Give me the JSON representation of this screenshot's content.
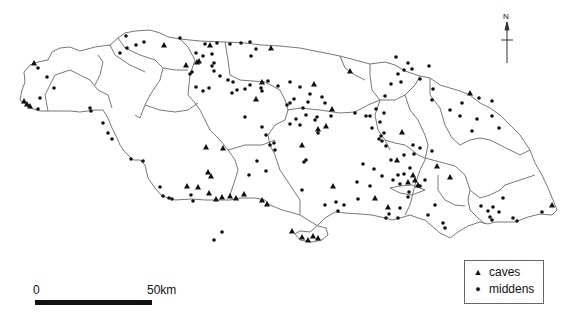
{
  "map": {
    "region": "Jamaica",
    "outline_color": "#777777",
    "symbol_color": "#111111"
  },
  "legend": {
    "items": [
      {
        "symbol": "triangle",
        "label": "caves"
      },
      {
        "symbol": "dot",
        "label": "middens"
      }
    ]
  },
  "scale_bar": {
    "start_label": "0",
    "end_label": "50km"
  },
  "north_arrow": {
    "label": "N"
  },
  "sites": {
    "caves": [
      [
        34,
        63
      ],
      [
        24,
        101
      ],
      [
        27,
        104
      ],
      [
        30,
        106
      ],
      [
        164,
        45
      ],
      [
        210,
        45
      ],
      [
        199,
        61
      ],
      [
        271,
        48
      ],
      [
        262,
        82
      ],
      [
        256,
        99
      ],
      [
        197,
        62
      ],
      [
        186,
        65
      ],
      [
        350,
        71
      ],
      [
        314,
        84
      ],
      [
        332,
        109
      ],
      [
        470,
        93
      ],
      [
        402,
        132
      ],
      [
        302,
        145
      ],
      [
        318,
        129
      ],
      [
        326,
        126
      ],
      [
        206,
        147
      ],
      [
        223,
        148
      ],
      [
        208,
        172
      ],
      [
        211,
        176
      ],
      [
        198,
        187
      ],
      [
        209,
        193
      ],
      [
        244,
        194
      ],
      [
        236,
        198
      ],
      [
        222,
        197
      ],
      [
        230,
        196
      ],
      [
        216,
        199
      ],
      [
        187,
        186
      ],
      [
        262,
        200
      ],
      [
        267,
        204
      ],
      [
        313,
        236
      ],
      [
        318,
        238
      ],
      [
        302,
        237
      ],
      [
        308,
        240
      ],
      [
        292,
        231
      ],
      [
        333,
        186
      ],
      [
        388,
        207
      ],
      [
        413,
        175
      ],
      [
        415,
        180
      ],
      [
        408,
        182
      ],
      [
        418,
        185
      ],
      [
        437,
        166
      ],
      [
        450,
        177
      ],
      [
        375,
        198
      ],
      [
        397,
        160
      ],
      [
        552,
        205
      ]
    ],
    "middens": [
      [
        38,
        68
      ],
      [
        47,
        77
      ],
      [
        54,
        88
      ],
      [
        40,
        98
      ],
      [
        38,
        109
      ],
      [
        90,
        108
      ],
      [
        91,
        111
      ],
      [
        103,
        123
      ],
      [
        108,
        133
      ],
      [
        112,
        139
      ],
      [
        131,
        159
      ],
      [
        143,
        161
      ],
      [
        160,
        187
      ],
      [
        163,
        196
      ],
      [
        169,
        198
      ],
      [
        172,
        199
      ],
      [
        191,
        195
      ],
      [
        193,
        201
      ],
      [
        222,
        232
      ],
      [
        214,
        240
      ],
      [
        257,
        161
      ],
      [
        266,
        171
      ],
      [
        274,
        143
      ],
      [
        245,
        117
      ],
      [
        126,
        36
      ],
      [
        120,
        53
      ],
      [
        144,
        42
      ],
      [
        136,
        45
      ],
      [
        127,
        48
      ],
      [
        180,
        38
      ],
      [
        230,
        44
      ],
      [
        205,
        44
      ],
      [
        217,
        43
      ],
      [
        241,
        43
      ],
      [
        250,
        42
      ],
      [
        256,
        49
      ],
      [
        196,
        53
      ],
      [
        203,
        56
      ],
      [
        212,
        54
      ],
      [
        251,
        56
      ],
      [
        214,
        63
      ],
      [
        212,
        66
      ],
      [
        214,
        71
      ],
      [
        192,
        72
      ],
      [
        190,
        74
      ],
      [
        220,
        76
      ],
      [
        228,
        80
      ],
      [
        233,
        82
      ],
      [
        196,
        87
      ],
      [
        203,
        91
      ],
      [
        209,
        88
      ],
      [
        232,
        93
      ],
      [
        237,
        90
      ],
      [
        245,
        89
      ],
      [
        250,
        85
      ],
      [
        261,
        88
      ],
      [
        262,
        91
      ],
      [
        268,
        81
      ],
      [
        278,
        86
      ],
      [
        290,
        82
      ],
      [
        300,
        87
      ],
      [
        310,
        94
      ],
      [
        322,
        97
      ],
      [
        325,
        103
      ],
      [
        317,
        117
      ],
      [
        318,
        133
      ],
      [
        300,
        125
      ],
      [
        294,
        99
      ],
      [
        290,
        103
      ],
      [
        303,
        108
      ],
      [
        308,
        102
      ],
      [
        306,
        115
      ],
      [
        315,
        120
      ],
      [
        331,
        116
      ],
      [
        355,
        113
      ],
      [
        366,
        116
      ],
      [
        370,
        116
      ],
      [
        376,
        109
      ],
      [
        380,
        122
      ],
      [
        372,
        128
      ],
      [
        384,
        113
      ],
      [
        385,
        96
      ],
      [
        391,
        84
      ],
      [
        404,
        70
      ],
      [
        408,
        63
      ],
      [
        412,
        69
      ],
      [
        398,
        74
      ],
      [
        396,
        57
      ],
      [
        401,
        82
      ],
      [
        420,
        79
      ],
      [
        429,
        66
      ],
      [
        433,
        89
      ],
      [
        432,
        100
      ],
      [
        450,
        110
      ],
      [
        479,
        98
      ],
      [
        492,
        101
      ],
      [
        477,
        119
      ],
      [
        492,
        116
      ],
      [
        499,
        128
      ],
      [
        462,
        103
      ],
      [
        460,
        116
      ],
      [
        472,
        131
      ],
      [
        432,
        151
      ],
      [
        420,
        148
      ],
      [
        414,
        154
      ],
      [
        420,
        186
      ],
      [
        409,
        192
      ],
      [
        408,
        197
      ],
      [
        400,
        208
      ],
      [
        389,
        214
      ],
      [
        386,
        218
      ],
      [
        398,
        218
      ],
      [
        435,
        205
      ],
      [
        428,
        215
      ],
      [
        443,
        223
      ],
      [
        445,
        228
      ],
      [
        481,
        206
      ],
      [
        488,
        211
      ],
      [
        493,
        207
      ],
      [
        490,
        217
      ],
      [
        499,
        212
      ],
      [
        503,
        198
      ],
      [
        492,
        220
      ],
      [
        542,
        212
      ],
      [
        517,
        221
      ],
      [
        513,
        218
      ],
      [
        381,
        136
      ],
      [
        384,
        133
      ],
      [
        379,
        139
      ],
      [
        382,
        141
      ],
      [
        386,
        146
      ],
      [
        398,
        175
      ],
      [
        404,
        174
      ],
      [
        393,
        180
      ],
      [
        400,
        184
      ],
      [
        425,
        180
      ],
      [
        410,
        168
      ],
      [
        391,
        160
      ],
      [
        404,
        155
      ],
      [
        413,
        145
      ],
      [
        374,
        169
      ],
      [
        382,
        176
      ],
      [
        302,
        190
      ],
      [
        336,
        202
      ],
      [
        325,
        205
      ],
      [
        338,
        211
      ],
      [
        344,
        205
      ],
      [
        358,
        199
      ],
      [
        357,
        182
      ],
      [
        363,
        164
      ],
      [
        370,
        186
      ],
      [
        290,
        124
      ],
      [
        296,
        119
      ],
      [
        306,
        160
      ],
      [
        304,
        162
      ],
      [
        249,
        175
      ],
      [
        287,
        105
      ],
      [
        262,
        127
      ],
      [
        270,
        145
      ],
      [
        275,
        150
      ],
      [
        266,
        135
      ]
    ]
  }
}
